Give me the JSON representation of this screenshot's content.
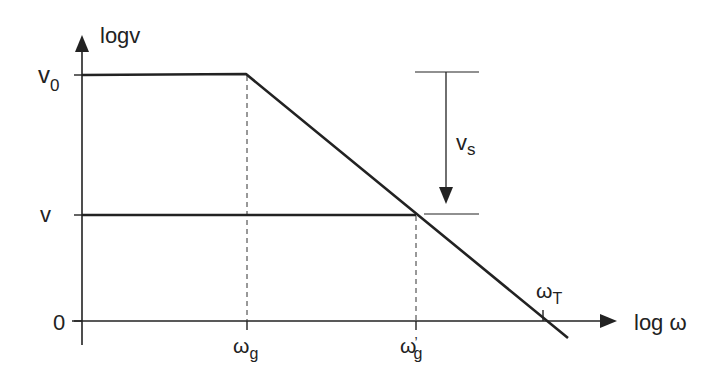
{
  "diagram": {
    "type": "bode-magnitude-asymptote",
    "y_axis_label": "logv",
    "x_axis_label": "log ω",
    "y_ticks": {
      "v0": {
        "main": "v",
        "sub": "0"
      },
      "v": {
        "main": "v"
      },
      "zero": {
        "main": "0"
      }
    },
    "x_ticks": {
      "wg": {
        "main": "ω",
        "sub": "g"
      },
      "wg_prime": {
        "main": "ω",
        "prime": "’",
        "sub": "g"
      },
      "wT": {
        "main": "ω",
        "sub": "T"
      }
    },
    "annotation": {
      "main": "v",
      "sub": "s"
    },
    "colors": {
      "line": "#222222",
      "background": "#ffffff"
    }
  }
}
